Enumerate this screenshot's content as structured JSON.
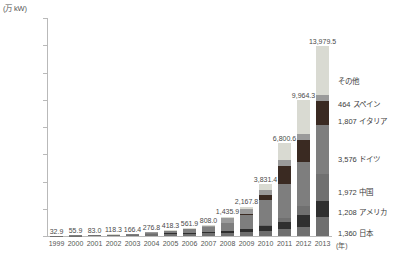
{
  "chart_data": {
    "type": "bar",
    "title": "",
    "unit_label": "(万 kW)",
    "xlabel": "(年)",
    "ylabel": "",
    "ylim": [
      0,
      16000
    ],
    "ytick_step": 2000,
    "grid": false,
    "stacked": true,
    "legend_position": "right",
    "ytick_labels": [
      "0",
      "2,000",
      "4,000",
      "6,000",
      "8,000",
      "10,000",
      "12,000",
      "14,000",
      "16,000"
    ],
    "ytick_values": [
      0,
      2000,
      4000,
      6000,
      8000,
      10000,
      12000,
      14000,
      16000
    ],
    "categories": [
      "1999",
      "2000",
      "2001",
      "2002",
      "2003",
      "2004",
      "2005",
      "2006",
      "2007",
      "2008",
      "2009",
      "2010",
      "2011",
      "2012",
      "2013"
    ],
    "total_labels": [
      "32.9",
      "55.9",
      "83.0",
      "118.3",
      "166.4",
      "276.8",
      "418.3",
      "561.9",
      "808.0",
      "1,435.9",
      "2,167.8",
      "3,831.4",
      "6,800.6",
      "9,964.3",
      "13,979.5"
    ],
    "totals": [
      32.9,
      55.9,
      83.0,
      118.3,
      166.4,
      276.8,
      418.3,
      561.9,
      808.0,
      1435.9,
      2167.8,
      3831.4,
      6800.6,
      9964.3,
      13979.5
    ],
    "series": [
      {
        "name": "日本",
        "color": "#6f6f6f",
        "legend_value": "1,360",
        "values": [
          20.9,
          33.0,
          45.2,
          63.7,
          86.0,
          113.2,
          142.2,
          170.9,
          191.9,
          214.4,
          262.9,
          363.2,
          489.7,
          676.6,
          1360.0
        ]
      },
      {
        "name": "アメリカ",
        "color": "#2f2f2f",
        "legend_value": "1,208",
        "values": [
          3.0,
          4.0,
          6.0,
          9.0,
          15.0,
          26.0,
          48.0,
          62.4,
          83.0,
          133.9,
          248.0,
          390.0,
          567.0,
          833.0,
          1208.0
        ]
      },
      {
        "name": "中国",
        "color": "#707070",
        "legend_value": "1,972",
        "values": [
          1.0,
          1.5,
          2.0,
          3.5,
          5.5,
          6.5,
          7.0,
          8.0,
          10.0,
          14.0,
          30.0,
          80.0,
          300.0,
          682.0,
          1972.0
        ]
      },
      {
        "name": "ドイツ",
        "color": "#7e7e7e",
        "legend_value": "3,576",
        "values": [
          6.9,
          11.4,
          18.6,
          29.6,
          43.5,
          110.5,
          198.0,
          265.9,
          386.2,
          579.9,
          986.9,
          1791.4,
          2494.9,
          3235.0,
          3576.0
        ]
      },
      {
        "name": "イタリア",
        "color": "#3a2a22",
        "legend_value": "1,807",
        "values": [
          1.0,
          1.5,
          2.0,
          2.2,
          2.6,
          3.1,
          3.5,
          4.7,
          12.0,
          45.8,
          120.0,
          355.0,
          1280.0,
          1625.0,
          1807.0
        ]
      },
      {
        "name": "スペイン",
        "color": "#9a9a9a",
        "legend_value": "464",
        "values": [
          0.1,
          0.5,
          1.2,
          2.3,
          3.8,
          5.5,
          7.6,
          15.0,
          69.3,
          337.4,
          357.0,
          386.0,
          429.0,
          453.0,
          464.0
        ]
      },
      {
        "name": "その他",
        "color": "#d9dad2",
        "legend_value": "",
        "values": [
          0.0,
          4.0,
          8.0,
          8.0,
          10.0,
          12.0,
          12.0,
          35.0,
          55.6,
          110.5,
          163.0,
          465.8,
          1240.0,
          2459.7,
          3592.5
        ]
      }
    ],
    "legend_entries": [
      {
        "label": "その他",
        "value": "",
        "color": "#d9dad2",
        "y": 80
      },
      {
        "label": "スペイン",
        "value": "464",
        "color": "#9a9a9a",
        "y": 103
      },
      {
        "label": "イタリア",
        "value": "1,807",
        "color": "#3a2a22",
        "y": 120
      },
      {
        "label": "ドイツ",
        "value": "3,576",
        "color": "#7e7e7e",
        "y": 158
      },
      {
        "label": "中国",
        "value": "1,972",
        "color": "#707070",
        "y": 191
      },
      {
        "label": "アメリカ",
        "value": "1,208",
        "color": "#2f2f2f",
        "y": 211
      },
      {
        "label": "日本",
        "value": "1,360",
        "color": "#6f6f6f",
        "y": 232
      }
    ]
  }
}
